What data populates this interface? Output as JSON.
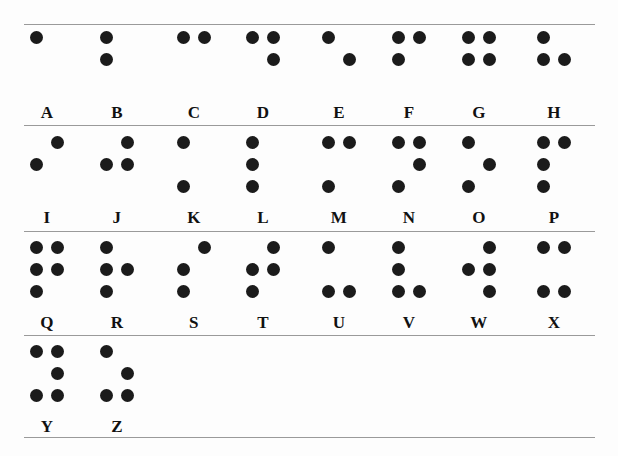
{
  "style": {
    "dot_color": "#1b1b1b",
    "rule_color": "#9a9a9a",
    "background": "#fdfdfd",
    "letter_color": "#111111"
  },
  "layout": {
    "rule_y": [
      24,
      125,
      231,
      335,
      437
    ],
    "row_top": [
      31,
      136,
      241,
      345
    ],
    "column_x": [
      30,
      100,
      177,
      246,
      322,
      392,
      462,
      537
    ],
    "dot_positions": [
      "1",
      "4",
      "2",
      "5",
      "3",
      "6"
    ]
  },
  "rows": [
    {
      "index": 0,
      "cells": [
        {
          "letter": "A",
          "dots": [
            1
          ]
        },
        {
          "letter": "B",
          "dots": [
            1,
            2
          ]
        },
        {
          "letter": "C",
          "dots": [
            1,
            4
          ]
        },
        {
          "letter": "D",
          "dots": [
            1,
            4,
            5
          ]
        },
        {
          "letter": "E",
          "dots": [
            1,
            5
          ]
        },
        {
          "letter": "F",
          "dots": [
            1,
            2,
            4
          ]
        },
        {
          "letter": "G",
          "dots": [
            1,
            2,
            4,
            5
          ]
        },
        {
          "letter": "H",
          "dots": [
            1,
            2,
            5
          ]
        }
      ]
    },
    {
      "index": 1,
      "cells": [
        {
          "letter": "I",
          "dots": [
            2,
            4
          ]
        },
        {
          "letter": "J",
          "dots": [
            2,
            4,
            5
          ]
        },
        {
          "letter": "K",
          "dots": [
            1,
            3
          ]
        },
        {
          "letter": "L",
          "dots": [
            1,
            2,
            3
          ]
        },
        {
          "letter": "M",
          "dots": [
            1,
            3,
            4
          ]
        },
        {
          "letter": "N",
          "dots": [
            1,
            3,
            4,
            5
          ]
        },
        {
          "letter": "O",
          "dots": [
            1,
            3,
            5
          ]
        },
        {
          "letter": "P",
          "dots": [
            1,
            2,
            3,
            4
          ]
        }
      ]
    },
    {
      "index": 2,
      "cells": [
        {
          "letter": "Q",
          "dots": [
            1,
            2,
            3,
            4,
            5
          ]
        },
        {
          "letter": "R",
          "dots": [
            1,
            2,
            3,
            5
          ]
        },
        {
          "letter": "S",
          "dots": [
            2,
            3,
            4
          ]
        },
        {
          "letter": "T",
          "dots": [
            2,
            3,
            4,
            5
          ]
        },
        {
          "letter": "U",
          "dots": [
            1,
            3,
            6
          ]
        },
        {
          "letter": "V",
          "dots": [
            1,
            2,
            3,
            6
          ]
        },
        {
          "letter": "W",
          "dots": [
            2,
            4,
            5,
            6
          ]
        },
        {
          "letter": "X",
          "dots": [
            1,
            3,
            4,
            6
          ]
        }
      ]
    },
    {
      "index": 3,
      "cells": [
        {
          "letter": "Y",
          "dots": [
            1,
            3,
            4,
            5,
            6
          ]
        },
        {
          "letter": "Z",
          "dots": [
            1,
            3,
            5,
            6
          ]
        }
      ]
    }
  ]
}
